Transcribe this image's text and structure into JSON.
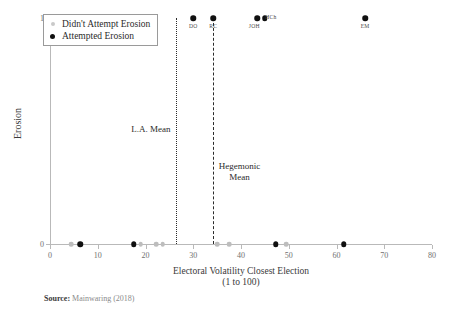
{
  "chart_data": {
    "type": "scatter",
    "title": "",
    "xlabel": "Electoral Volatility Closest Election",
    "xlabel_sub": "(1 to 100)",
    "ylabel": "Erosion",
    "xlim": [
      0,
      80
    ],
    "ylim": [
      0,
      1
    ],
    "xticks": [
      0,
      10,
      20,
      30,
      40,
      50,
      60,
      70,
      80
    ],
    "yticks": [
      0,
      1
    ],
    "grid": false,
    "legend_position": "top-left",
    "series": [
      {
        "name": "Didn't Attempt Erosion",
        "color": "#bdbdbd",
        "points": [
          {
            "x": 4.5,
            "y": 0,
            "label": ""
          },
          {
            "x": 19.0,
            "y": 0,
            "label": ""
          },
          {
            "x": 22.3,
            "y": 0,
            "label": ""
          },
          {
            "x": 23.6,
            "y": 0,
            "label": ""
          },
          {
            "x": 35.0,
            "y": 0,
            "label": ""
          },
          {
            "x": 37.5,
            "y": 0,
            "label": ""
          },
          {
            "x": 49.5,
            "y": 0,
            "label": ""
          }
        ]
      },
      {
        "name": "Attempted Erosion",
        "color": "#101010",
        "points": [
          {
            "x": 6.3,
            "y": 0,
            "label": ""
          },
          {
            "x": 17.5,
            "y": 0,
            "label": ""
          },
          {
            "x": 47.3,
            "y": 0,
            "label": ""
          },
          {
            "x": 61.5,
            "y": 0,
            "label": ""
          },
          {
            "x": 30.0,
            "y": 1,
            "label": "DO"
          },
          {
            "x": 34.2,
            "y": 1,
            "label": "RC"
          },
          {
            "x": 43.4,
            "y": 1,
            "label": "JOH"
          },
          {
            "x": 45.0,
            "y": 1,
            "label": "HCh"
          },
          {
            "x": 66.0,
            "y": 1,
            "label": "EM"
          }
        ]
      }
    ],
    "reference_lines": [
      {
        "name": "L.A. Mean",
        "x": 26.3,
        "style": "dotted",
        "label": "L.A. Mean",
        "label_side": "left"
      },
      {
        "name": "Hegemonic Mean",
        "x": 34.1,
        "style": "dashed",
        "label": "Hegemonic\nMean",
        "label_side": "right"
      }
    ],
    "annotations": [
      {
        "text": "L.A. Mean"
      },
      {
        "text": "Hegemonic\nMean"
      }
    ]
  },
  "legend": {
    "items": [
      {
        "label": "Didn't Attempt Erosion",
        "marker": "light-gray-dot"
      },
      {
        "label": "Attempted Erosion",
        "marker": "black-dot"
      }
    ]
  },
  "source": {
    "label": "Source:",
    "text": "Mainwaring (2018)"
  },
  "colors": {
    "attempted": "#101010",
    "not_attempted": "#bdbdbd",
    "axis": "#b9b9b9",
    "text": "#3a3a3a",
    "source_text": "#8a8a8a"
  }
}
